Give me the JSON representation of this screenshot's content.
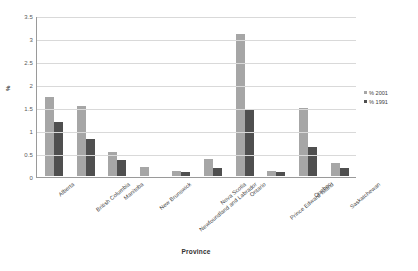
{
  "chart_data": {
    "type": "bar",
    "title": "",
    "xlabel": "Province",
    "ylabel": "%",
    "ylim": [
      0,
      3.5
    ],
    "ytick_labels": [
      "3.5",
      "3",
      "2.5",
      "2",
      "1.5",
      "1",
      "0.5",
      "0"
    ],
    "ytick_values": [
      3.5,
      3,
      2.5,
      2,
      1.5,
      1,
      0.5,
      0
    ],
    "grid": true,
    "legend_position": "right",
    "categories": [
      "Alberta",
      "British Columbia",
      "Manitoba",
      "New Brunswick",
      "Newfoundland and Labrador",
      "Nova Scotia",
      "Ontario",
      "Prince Edward Island",
      "Quebec",
      "Saskatchewan"
    ],
    "series": [
      {
        "name": "% 2001",
        "color": "#a6a6a6",
        "values": [
          1.72,
          1.52,
          0.52,
          0.2,
          0.1,
          0.37,
          3.08,
          0.1,
          1.47,
          0.28
        ]
      },
      {
        "name": "% 1991",
        "color": "#4f4f4f",
        "values": [
          1.18,
          0.8,
          0.35,
          0.0,
          0.09,
          0.18,
          1.45,
          0.08,
          0.63,
          0.17
        ]
      }
    ]
  }
}
